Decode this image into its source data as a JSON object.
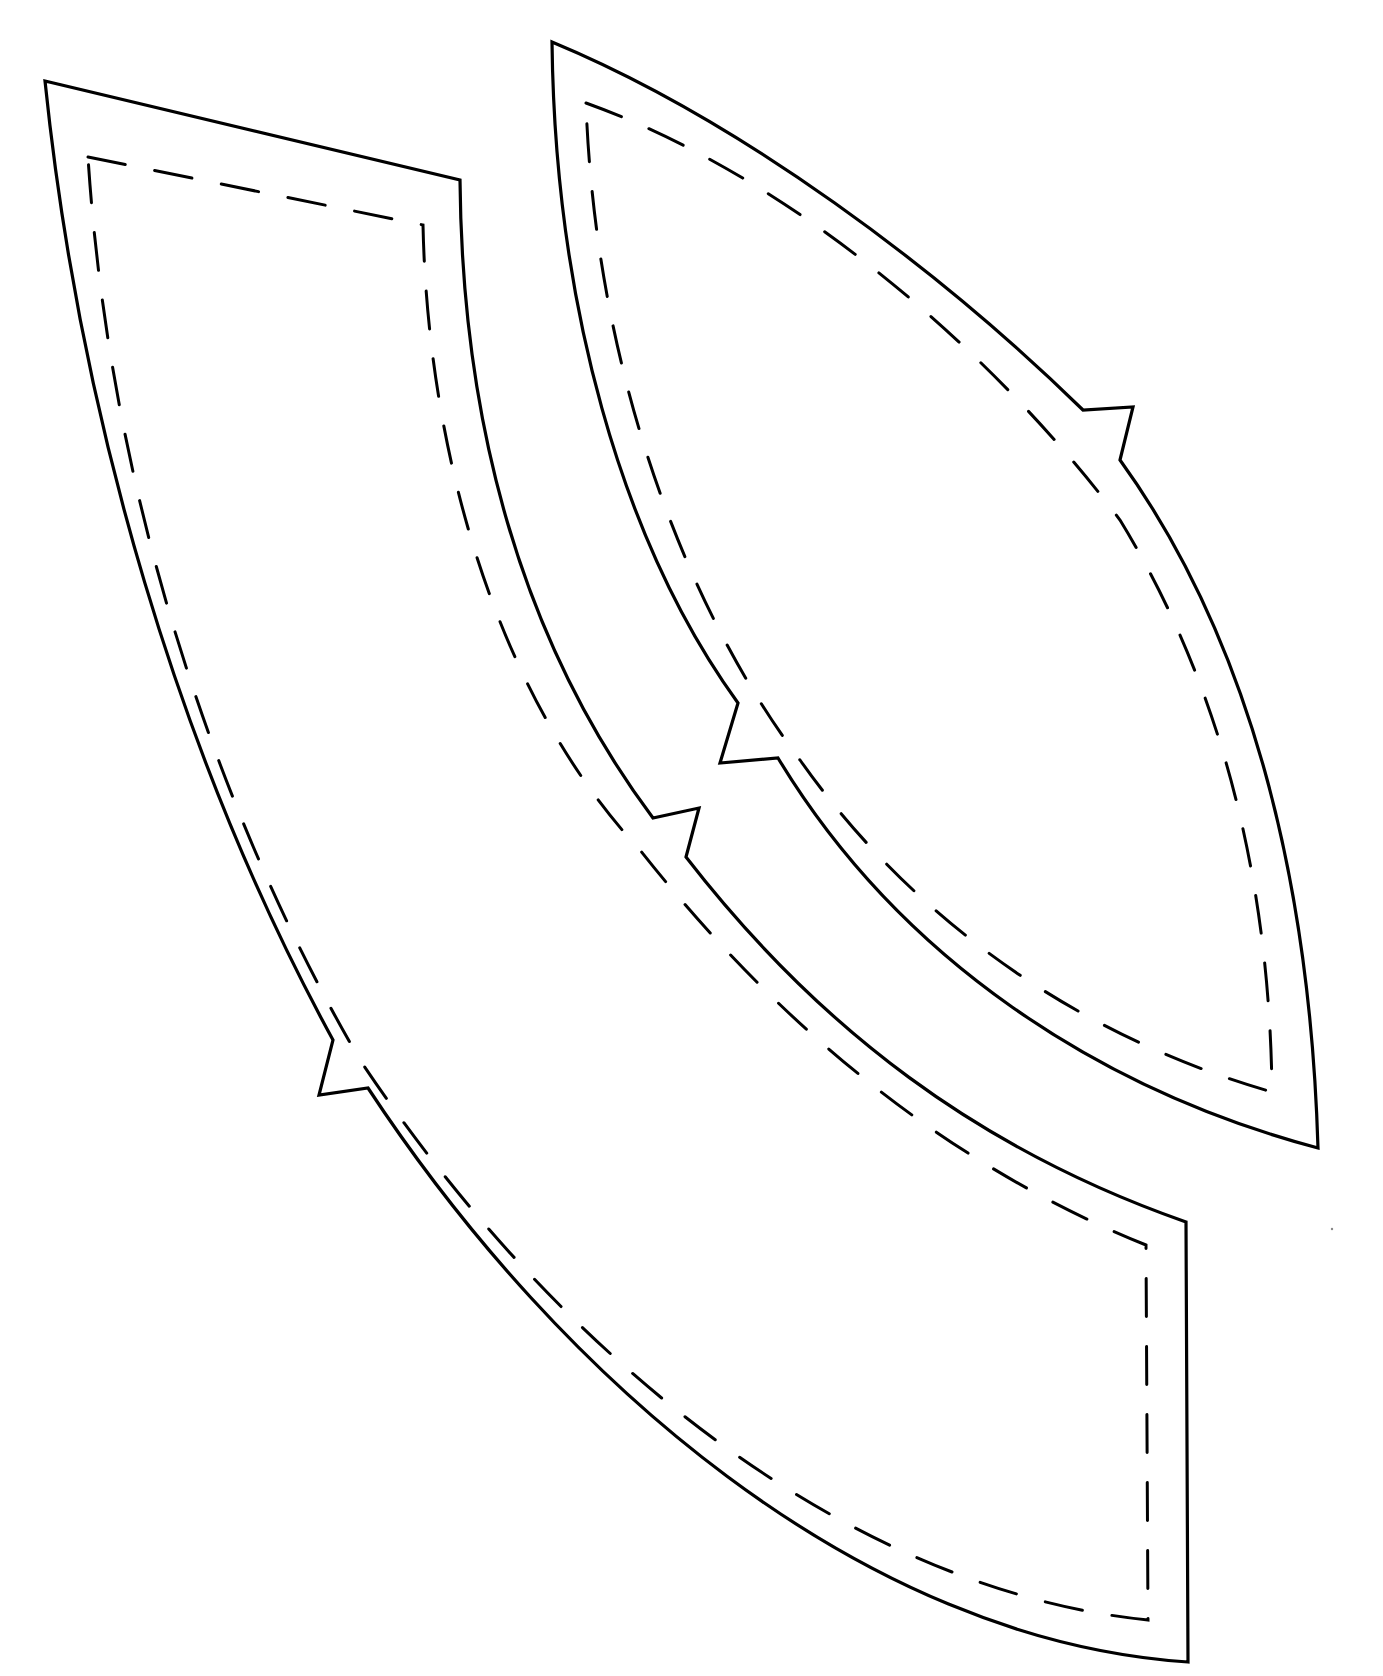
{
  "diagram": {
    "type": "sewing-pattern",
    "background_color": "#ffffff",
    "line_color": "#000000",
    "pieces": [
      {
        "id": "piece-a",
        "shape": "curved band (elongated quadrilateral with curved long sides)",
        "cut_line": "solid",
        "seam_line": "dashed",
        "notches": 2
      },
      {
        "id": "piece-b",
        "shape": "pointed oval / leaf",
        "cut_line": "solid",
        "seam_line": "dashed",
        "notches": 2
      }
    ]
  }
}
